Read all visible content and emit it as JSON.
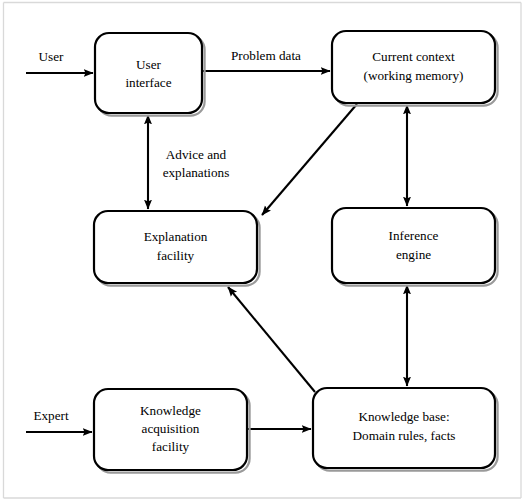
{
  "diagram": {
    "canvas": {
      "width": 525,
      "height": 501
    },
    "colors": {
      "stroke": "#000000",
      "background": "#ffffff",
      "shadow": "#9a9a9a",
      "frame": "#d9d9d9"
    },
    "nodes": [
      {
        "id": "user-interface",
        "lines": [
          "User",
          "interface"
        ],
        "x": 95,
        "y": 33,
        "w": 107,
        "h": 80,
        "r": 14
      },
      {
        "id": "current-context",
        "lines": [
          "Current context",
          "(working memory)"
        ],
        "x": 332,
        "y": 31,
        "w": 163,
        "h": 72,
        "r": 14
      },
      {
        "id": "explanation-facility",
        "lines": [
          "Explanation",
          "facility"
        ],
        "x": 94,
        "y": 211,
        "w": 163,
        "h": 72,
        "r": 14
      },
      {
        "id": "inference-engine",
        "lines": [
          "Inference",
          "engine"
        ],
        "x": 332,
        "y": 208,
        "w": 163,
        "h": 75,
        "r": 14
      },
      {
        "id": "knowledge-acquisition-facility",
        "lines": [
          "Knowledge",
          "acquisition",
          "facility"
        ],
        "x": 94,
        "y": 389,
        "w": 153,
        "h": 81,
        "r": 14
      },
      {
        "id": "knowledge-base",
        "lines": [
          "Knowledge base:",
          "Domain rules, facts"
        ],
        "x": 313,
        "y": 388,
        "w": 182,
        "h": 80,
        "r": 14
      }
    ],
    "edges": [
      {
        "id": "user-input",
        "label": "User",
        "from": "external-user",
        "to": "user-interface"
      },
      {
        "id": "problem-data",
        "label": "Problem data",
        "from": "user-interface",
        "to": "current-context"
      },
      {
        "id": "advice-and-explanations",
        "label": "Advice and\nexplanations",
        "from": "explanation-facility",
        "to": "user-interface",
        "bidirectional": true
      },
      {
        "id": "context-to-explanation",
        "label": "",
        "from": "current-context",
        "to": "explanation-facility"
      },
      {
        "id": "context-inference",
        "label": "",
        "from": "current-context",
        "to": "inference-engine",
        "bidirectional": true
      },
      {
        "id": "inference-knowledge-base",
        "label": "",
        "from": "inference-engine",
        "to": "knowledge-base",
        "bidirectional": true
      },
      {
        "id": "knowledge-base-to-explanation",
        "label": "",
        "from": "knowledge-base",
        "to": "explanation-facility"
      },
      {
        "id": "expert-input",
        "label": "Expert",
        "from": "external-expert",
        "to": "knowledge-acquisition-facility"
      },
      {
        "id": "acquisition-to-knowledge-base",
        "label": "",
        "from": "knowledge-acquisition-facility",
        "to": "knowledge-base"
      }
    ],
    "labels": {
      "user": "User",
      "expert": "Expert",
      "problem_data": "Problem data",
      "advice_line1": "Advice and",
      "advice_line2": "explanations"
    },
    "node_text": {
      "user_interface_line1": "User",
      "user_interface_line2": "interface",
      "current_context_line1": "Current context",
      "current_context_line2": "(working memory)",
      "explanation_line1": "Explanation",
      "explanation_line2": "facility",
      "inference_line1": "Inference",
      "inference_line2": "engine",
      "acquisition_line1": "Knowledge",
      "acquisition_line2": "acquisition",
      "acquisition_line3": "facility",
      "knowledge_base_line1": "Knowledge base:",
      "knowledge_base_line2": "Domain rules, facts"
    }
  }
}
